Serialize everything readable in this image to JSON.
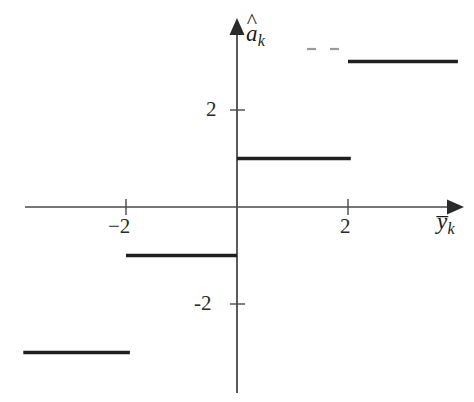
{
  "figure": {
    "title": "",
    "background_color": "#ffffff",
    "line_color": "#1f1f1f",
    "axis_color": "#3c3c3c"
  },
  "axes": {
    "y_axis": {
      "label_base": "a",
      "label_accent": "^",
      "label_subscript": "k",
      "label_plain": "â_k",
      "ticks": [
        {
          "value": 2,
          "text": "2"
        },
        {
          "value": -2,
          "text": "-2"
        }
      ]
    },
    "x_axis": {
      "label_base": "y",
      "label_accent": "–",
      "label_subscript": "k",
      "label_plain": "ȳ_k",
      "ticks": [
        {
          "value": -2,
          "text": "−2"
        },
        {
          "value": 2,
          "text": "2"
        }
      ]
    }
  },
  "annotations": {
    "ellipsis_dashes": 2
  },
  "chart_data": {
    "type": "line",
    "title": "",
    "xlabel": "ȳ_k",
    "ylabel": "â_k",
    "xlim": [
      -4.0,
      4.0
    ],
    "ylim": [
      -4.0,
      4.0
    ],
    "grid": false,
    "legend": "none",
    "x_ticks": [
      -2,
      2
    ],
    "y_ticks": [
      -2,
      2
    ],
    "series": [
      {
        "name": "quantizer",
        "style": "step",
        "segments": [
          {
            "x_start": -3.85,
            "x_end": -1.93,
            "y": -3,
            "x_start_open": true,
            "x_end_open": true
          },
          {
            "x_start": -2.0,
            "x_end": 0.0,
            "y": -1,
            "x_start_open": true,
            "x_end_open": true
          },
          {
            "x_start": 0.0,
            "x_end": 2.05,
            "y": 1,
            "x_start_open": true,
            "x_end_open": true
          },
          {
            "x_start": 2.0,
            "x_end": 3.98,
            "y": 3,
            "x_start_open": true,
            "x_end_open": true
          }
        ]
      }
    ]
  }
}
